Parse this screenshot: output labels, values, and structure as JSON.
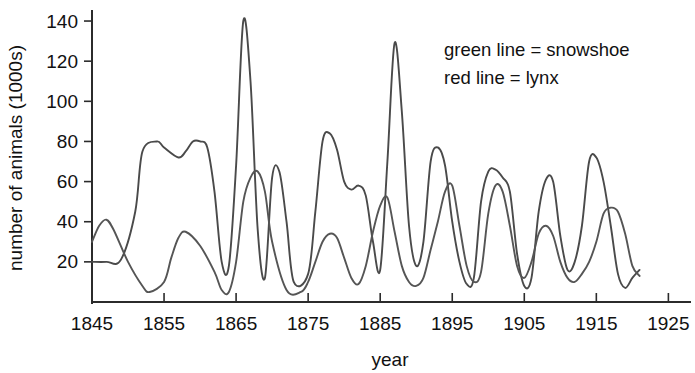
{
  "chart_data": {
    "type": "line",
    "title": "",
    "xlabel": "year",
    "ylabel": "number of animals (1000s)",
    "xlim": [
      1845,
      1928
    ],
    "ylim": [
      0,
      145
    ],
    "xticks": [
      1845,
      1855,
      1865,
      1875,
      1885,
      1895,
      1905,
      1915,
      1925
    ],
    "xticklabels": [
      "1845",
      "1855",
      "1865",
      "1875",
      "1885",
      "1895",
      "1905",
      "1915",
      "1925"
    ],
    "yticks": [
      20,
      40,
      60,
      80,
      100,
      120,
      140
    ],
    "yticklabels": [
      "20",
      "40",
      "60",
      "80",
      "100",
      "120",
      "140"
    ],
    "grid": false,
    "legend_position": "upper-right",
    "legend": [
      {
        "key": "snowshoe",
        "text": "green line = snowshoe",
        "color": "#4a4a4a"
      },
      {
        "key": "lynx",
        "text": "red line = lynx",
        "color": "#4a4a4a"
      }
    ],
    "series": [
      {
        "name": "snowshoe",
        "label": "green line = snowshoe",
        "color": "#4a4a4a",
        "x": [
          1845,
          1847,
          1849,
          1851,
          1852,
          1854,
          1855,
          1857,
          1858,
          1859,
          1860,
          1861,
          1862,
          1863,
          1864,
          1865,
          1866,
          1867,
          1868,
          1869,
          1870,
          1871,
          1872,
          1873,
          1875,
          1876,
          1877,
          1878,
          1879,
          1880,
          1881,
          1882,
          1883,
          1884,
          1885,
          1886,
          1887,
          1888,
          1889,
          1890,
          1891,
          1892,
          1893,
          1894,
          1895,
          1896,
          1897,
          1898,
          1899,
          1900,
          1901,
          1902,
          1903,
          1904,
          1905,
          1906,
          1907,
          1908,
          1909,
          1910,
          1911,
          1912,
          1913,
          1914,
          1915,
          1916,
          1917,
          1918,
          1919,
          1920,
          1921
        ],
        "y": [
          20,
          20,
          21,
          45,
          75,
          80,
          77,
          72,
          75,
          80,
          80,
          77,
          55,
          20,
          18,
          68,
          140,
          110,
          36,
          12,
          62,
          65,
          40,
          10,
          14,
          45,
          80,
          84,
          76,
          60,
          56,
          58,
          53,
          30,
          16,
          70,
          129,
          95,
          38,
          18,
          30,
          70,
          77,
          68,
          40,
          20,
          9,
          12,
          50,
          65,
          66,
          62,
          55,
          24,
          8,
          12,
          45,
          61,
          60,
          33,
          16,
          20,
          38,
          70,
          72,
          60,
          38,
          14,
          7,
          12,
          16
        ]
      },
      {
        "name": "lynx",
        "label": "red line = lynx",
        "color": "#555555",
        "x": [
          1845,
          1846,
          1847,
          1848,
          1850,
          1852,
          1853,
          1855,
          1856,
          1857,
          1858,
          1860,
          1862,
          1863,
          1864,
          1865,
          1866,
          1867,
          1868,
          1869,
          1870,
          1872,
          1874,
          1875,
          1876,
          1877,
          1878,
          1879,
          1880,
          1881,
          1882,
          1883,
          1884,
          1885,
          1886,
          1887,
          1888,
          1889,
          1890,
          1891,
          1892,
          1893,
          1894,
          1895,
          1896,
          1897,
          1898,
          1899,
          1900,
          1901,
          1902,
          1903,
          1904,
          1905,
          1906,
          1907,
          1908,
          1909,
          1910,
          1911,
          1912,
          1913,
          1914,
          1915,
          1916,
          1917,
          1918,
          1919,
          1920,
          1921
        ],
        "y": [
          30,
          38,
          41,
          36,
          20,
          8,
          5,
          10,
          22,
          32,
          35,
          28,
          15,
          6,
          5,
          20,
          50,
          62,
          65,
          55,
          30,
          6,
          5,
          10,
          20,
          30,
          34,
          32,
          22,
          12,
          9,
          18,
          35,
          48,
          52,
          35,
          18,
          10,
          8,
          12,
          26,
          40,
          55,
          58,
          38,
          18,
          10,
          15,
          44,
          58,
          55,
          38,
          18,
          12,
          20,
          34,
          38,
          33,
          20,
          12,
          10,
          14,
          20,
          30,
          44,
          47,
          45,
          34,
          18,
          13
        ]
      }
    ]
  }
}
